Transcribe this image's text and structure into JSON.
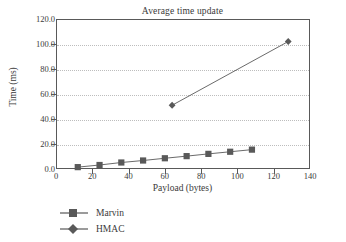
{
  "chart_data": {
    "type": "line",
    "title": "Average time update",
    "xlabel": "Payload (bytes)",
    "ylabel": "Time (ms)",
    "xlim": [
      0,
      140
    ],
    "ylim": [
      0,
      120
    ],
    "xticks": [
      "0",
      "20",
      "40",
      "60",
      "80",
      "100",
      "120",
      "140"
    ],
    "xtick_values": [
      0,
      20,
      40,
      60,
      80,
      100,
      120,
      140
    ],
    "yticks": [
      "0.0",
      "20.0",
      "40.0",
      "60.0",
      "80.0",
      "100.0",
      "120.0"
    ],
    "ytick_values": [
      0,
      20,
      40,
      60,
      80,
      100,
      120
    ],
    "grid": "horizontal-dotted",
    "legend_position": "below-left",
    "series": [
      {
        "name": "Marvin",
        "marker": "square",
        "color": "#595959",
        "x": [
          12,
          24,
          36,
          48,
          60,
          72,
          84,
          96,
          108
        ],
        "values": [
          1.5,
          3.2,
          5.2,
          6.8,
          8.6,
          10.3,
          12.1,
          13.8,
          15.5
        ]
      },
      {
        "name": "HMAC",
        "marker": "diamond",
        "color": "#595959",
        "x": [
          64,
          128
        ],
        "values": [
          51.0,
          102.0
        ]
      }
    ]
  },
  "legend": {
    "items": [
      {
        "label": "Marvin",
        "marker": "square-marker-icon"
      },
      {
        "label": "HMAC",
        "marker": "diamond-marker-icon"
      }
    ]
  },
  "colors": {
    "axis": "#595959",
    "grid": "#bdbdbd",
    "series": "#595959",
    "text": "#3a3a3a",
    "background": "#ffffff"
  }
}
